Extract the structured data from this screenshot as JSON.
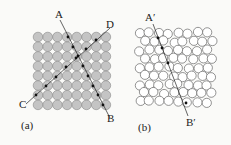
{
  "figure": {
    "panel_a": {
      "label": "(a)",
      "description": "square-packed atoms with two planes",
      "line_labels": {
        "A": "A",
        "B": "B",
        "C": "C",
        "D": "D"
      },
      "grid": {
        "rows": 8,
        "cols": 8
      },
      "fill": "#c4c4c4"
    },
    "panel_b": {
      "label": "(b)",
      "description": "disordered packing with one plane",
      "line_labels": {
        "A": "A′",
        "B": "B′"
      },
      "fill": "#ffffff"
    }
  }
}
